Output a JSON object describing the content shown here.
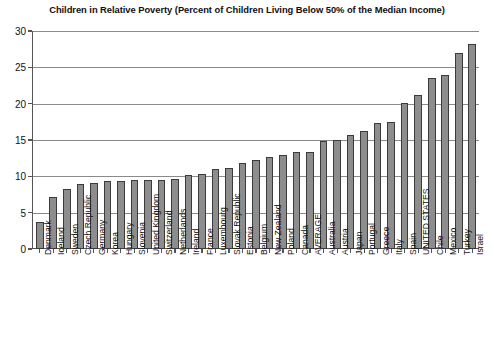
{
  "chart_data": {
    "type": "bar",
    "title": "Children in Relative Poverty (Percent of Children Living Below 50% of the Median Income)",
    "xlabel": "",
    "ylabel": "",
    "ylim": [
      0,
      30
    ],
    "ytick_step": 5,
    "yticks": [
      30,
      25,
      20,
      15,
      10,
      5,
      0
    ],
    "grid": true,
    "legend": "none",
    "bar_color": "#8d8d8d",
    "bar_edge_color": "#3b3b3b",
    "axis_color": "#555555",
    "categories": [
      "Denmark",
      "Iceland",
      "Sweden",
      "Czech Republic",
      "Germany",
      "Korea",
      "Hungary",
      "Slovenia",
      "United Kingdom",
      "Switzerland",
      "Netherlands",
      "Ireland",
      "France",
      "Luxembourg",
      "Slovak Republic",
      "Estonia",
      "Belgium",
      "New Zealand",
      "Poland",
      "Canada",
      "AVERAGE",
      "Australia",
      "Austria",
      "Japan",
      "Portugal",
      "Greece",
      "Italy",
      "Spain",
      "UNITED STATES",
      "Chile",
      "Mexico",
      "Turkey",
      "Israel"
    ],
    "values": [
      3.7,
      7.1,
      8.2,
      9.0,
      9.1,
      9.4,
      9.4,
      9.5,
      9.5,
      9.5,
      9.6,
      10.2,
      10.3,
      11.0,
      11.2,
      11.9,
      12.2,
      12.7,
      13.0,
      13.3,
      13.3,
      14.9,
      15.0,
      15.7,
      16.2,
      17.3,
      17.5,
      20.1,
      21.2,
      23.5,
      24.0,
      27.0,
      28.2
    ]
  }
}
